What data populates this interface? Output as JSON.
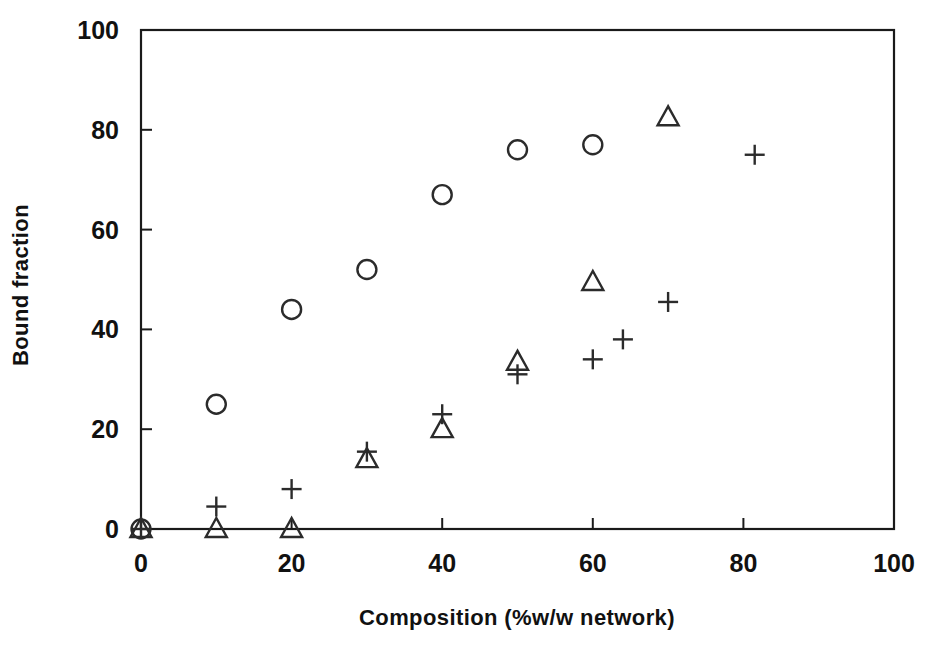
{
  "chart_data": {
    "type": "scatter",
    "title": "",
    "xlabel": "Composition (%w/w network)",
    "ylabel": "Bound fraction",
    "xlim": [
      0,
      100
    ],
    "ylim": [
      0,
      100
    ],
    "xticks": [
      "0",
      "20",
      "40",
      "60",
      "80",
      "100"
    ],
    "yticks": [
      "0",
      "20",
      "40",
      "60",
      "80",
      "100"
    ],
    "xtick_values": [
      0,
      20,
      40,
      60,
      80,
      100
    ],
    "ytick_values": [
      0,
      20,
      40,
      60,
      80,
      100
    ],
    "grid": false,
    "legend": "none",
    "frame": "box",
    "series": [
      {
        "name": "circle",
        "marker": "circle",
        "points": [
          {
            "x": 0,
            "y": 0
          },
          {
            "x": 10,
            "y": 25
          },
          {
            "x": 20,
            "y": 44
          },
          {
            "x": 30,
            "y": 52
          },
          {
            "x": 40,
            "y": 67
          },
          {
            "x": 50,
            "y": 76
          },
          {
            "x": 60,
            "y": 77
          }
        ]
      },
      {
        "name": "triangle",
        "marker": "triangle",
        "points": [
          {
            "x": 0,
            "y": 0
          },
          {
            "x": 10,
            "y": 0
          },
          {
            "x": 20,
            "y": 0
          },
          {
            "x": 30,
            "y": 14
          },
          {
            "x": 40,
            "y": 20
          },
          {
            "x": 50,
            "y": 33.5
          },
          {
            "x": 60,
            "y": 49.5
          },
          {
            "x": 70,
            "y": 82.5
          }
        ]
      },
      {
        "name": "plus",
        "marker": "plus",
        "points": [
          {
            "x": 0,
            "y": 0
          },
          {
            "x": 10,
            "y": 4.5
          },
          {
            "x": 20,
            "y": 8
          },
          {
            "x": 30,
            "y": 15.5
          },
          {
            "x": 40,
            "y": 23
          },
          {
            "x": 50,
            "y": 31
          },
          {
            "x": 60,
            "y": 34
          },
          {
            "x": 64,
            "y": 38
          },
          {
            "x": 70,
            "y": 45.5
          },
          {
            "x": 81.5,
            "y": 75
          }
        ]
      }
    ]
  }
}
